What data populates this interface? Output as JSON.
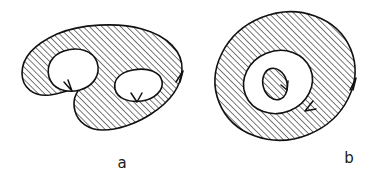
{
  "figure": {
    "background_color": "#ffffff",
    "ink_color": "#111111",
    "hatch_color": "#1a1a1a",
    "hatch_angle_degrees": 45,
    "hatch_spacing_px": 3.1,
    "panels": [
      {
        "id": "panel-a",
        "label": "a",
        "label_x": 122,
        "label_y": 168,
        "description": "bean-shaped multiply connected region with two holes",
        "fill": "hatched",
        "outer_boundary": {
          "path": "M 57 34 C 80 24, 118 22, 142 29 C 168 36, 183 52, 182 70 C 181 88, 168 103, 151 114 C 136 124, 117 130, 103 130 C 88 130, 78 122, 75 111 C 72 100, 76 92, 82 86 C 73 89, 62 93, 50 95 C 34 97, 22 88, 22 73 C 22 57, 35 44, 57 34 Z",
          "orientation": "counterclockwise",
          "arrow": {
            "x": 182,
            "y": 73,
            "direction": "up"
          }
        },
        "holes": [
          {
            "id": "hole-a-left",
            "path": "M 64 51 C 79 46, 93 51, 97 62 C 101 74, 94 86, 80 90 C 65 94, 52 88, 49 77 C 46 65, 52 55, 64 51 Z",
            "orientation": "clockwise",
            "arrow": {
              "x": 71,
              "y": 90,
              "direction": "down-right"
            }
          },
          {
            "id": "hole-a-right",
            "path": "M 133 70 C 148 67, 160 72, 162 81 C 164 90, 155 99, 142 101 C 128 103, 117 98, 115 89 C 113 79, 121 72, 133 70 Z",
            "orientation": "clockwise",
            "arrow": {
              "x": 137,
              "y": 101,
              "direction": "down-left"
            }
          }
        ]
      },
      {
        "id": "panel-b",
        "label": "b",
        "label_x": 349,
        "label_y": 163,
        "description": "tilted annulus with small hatched disk at its center",
        "fill": "hatched",
        "outer_boundary": {
          "cx": 285,
          "cy": 76,
          "rx": 71,
          "ry": 63,
          "rotation_degrees": -22,
          "orientation": "counterclockwise",
          "arrow": {
            "x": 355,
            "y": 80,
            "direction": "up"
          }
        },
        "holes": [
          {
            "id": "hole-b-annulus",
            "cx": 278,
            "cy": 82,
            "rx": 35,
            "ry": 31,
            "rotation_degrees": -22,
            "orientation": "clockwise",
            "arrow": {
              "x": 307,
              "y": 110,
              "direction": "down-left"
            }
          }
        ],
        "inner_disk": {
          "id": "inner-disk-b",
          "cx": 275,
          "cy": 84,
          "rx": 12,
          "ry": 16,
          "rotation_degrees": -16,
          "fill": "hatched",
          "orientation": "counterclockwise",
          "arrow": {
            "x": 287,
            "y": 89,
            "direction": "down-left"
          }
        }
      }
    ]
  }
}
